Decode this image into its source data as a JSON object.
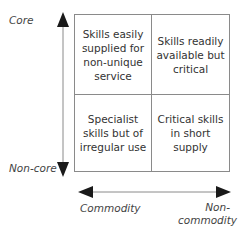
{
  "axes": {
    "y_top_label": "Core",
    "y_bottom_label": "Non-core",
    "x_left_label": "Commodity",
    "x_right_label": "Non-\ncommodity"
  },
  "quadrants": {
    "top_left": "Skills easily supplied for non-unique service",
    "top_right": "Skills readily available but critical",
    "bottom_left": "Specialist skills but of irregular use",
    "bottom_right": "Critical skills in short supply"
  },
  "colors": {
    "line": "#8a8a8a",
    "arrow": "#1a1a1a",
    "text": "#333333"
  }
}
